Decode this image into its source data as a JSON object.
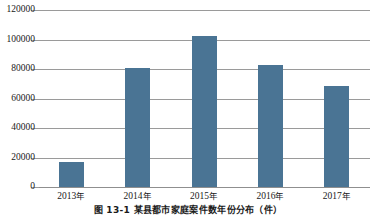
{
  "chart_data": {
    "type": "bar",
    "title": "",
    "subtitle": "",
    "xlabel": "",
    "ylabel": "",
    "categories": [
      "2013年",
      "2014年",
      "2015年",
      "2016年",
      "2017年"
    ],
    "values": [
      16700,
      80500,
      102500,
      83000,
      68700
    ],
    "series": [
      {
        "name": "案件数",
        "values": [
          16700,
          80500,
          102500,
          83000,
          68700
        ]
      }
    ],
    "ylim": [
      0,
      120000
    ],
    "yticks": [
      0,
      20000,
      40000,
      60000,
      80000,
      100000,
      120000
    ],
    "ytick_labels": [
      "0",
      "20000",
      "40000",
      "60000",
      "80000",
      "100000",
      "120000"
    ],
    "grid": true,
    "grid_axis": "y",
    "legend": false,
    "legend_position": "none",
    "bar_color": "#4a7494",
    "grid_color": "#9a9a9a",
    "axis_color": "#8f8f8f",
    "text_color": "#1a1a1a",
    "background": "#ffffff",
    "annotations": []
  },
  "caption": {
    "text": "图 13-1  某县都市家庭案件数年份分布（件）"
  }
}
